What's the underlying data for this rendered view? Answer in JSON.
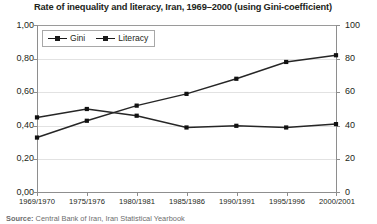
{
  "chart_data": {
    "type": "line",
    "title": "Rate of inequality and literacy, Iran, 1969–2000 (using Gini-coefficient)",
    "xlabel": "",
    "ylabel": "",
    "grid": true,
    "legend_position": "top-left",
    "categories": [
      "1969/1970",
      "1975/1976",
      "1980/1981",
      "1985/1986",
      "1990/1991",
      "1995/1996",
      "2000/2001"
    ],
    "series": [
      {
        "name": "Gini",
        "axis": "left",
        "marker": "square",
        "color": "#262626",
        "values": [
          0.45,
          0.5,
          0.46,
          0.39,
          0.4,
          0.39,
          0.41
        ]
      },
      {
        "name": "Literacy",
        "axis": "right",
        "marker": "square",
        "color": "#262626",
        "values": [
          33,
          43,
          52,
          59,
          68,
          78,
          82
        ]
      }
    ],
    "axis_left": {
      "label": "",
      "ylim": [
        0.0,
        1.0
      ],
      "ticks": [
        "0,00",
        "0,20",
        "0,40",
        "0,60",
        "0,80",
        "1,00"
      ],
      "tick_values": [
        0.0,
        0.2,
        0.4,
        0.6,
        0.8,
        1.0
      ]
    },
    "axis_right": {
      "label": "",
      "ylim": [
        0,
        100
      ],
      "ticks": [
        "0",
        "20",
        "40",
        "60",
        "80",
        "100"
      ],
      "tick_values": [
        0,
        20,
        40,
        60,
        80,
        100
      ]
    }
  },
  "legend": {
    "entries": [
      {
        "label": "Gini"
      },
      {
        "label": "Literacy"
      }
    ]
  },
  "footer": {
    "label": "Source:",
    "text": " Central Bank of Iran, Iran Statistical Yearbook"
  }
}
